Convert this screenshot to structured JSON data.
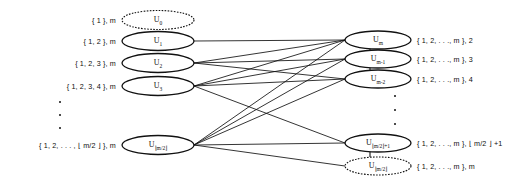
{
  "figure": {
    "background_color": "#ffffff",
    "line_color": "#111111",
    "left_column": {
      "nodes": [
        {
          "id": "u0",
          "label_base": "U",
          "label_sub": "0",
          "style": "dashed",
          "set_label": "{ 1 }, m",
          "cx": 158,
          "cy": 20,
          "rx": 36,
          "ry": 9.5
        },
        {
          "id": "u1",
          "label_base": "U",
          "label_sub": "1",
          "style": "solid",
          "set_label": "{ 1, 2 }, m",
          "cx": 158,
          "cy": 41,
          "rx": 36,
          "ry": 9.5
        },
        {
          "id": "u2",
          "label_base": "U",
          "label_sub": "2",
          "style": "solid",
          "set_label": "{ 1, 2, 3 }, m",
          "cx": 158,
          "cy": 63,
          "rx": 36,
          "ry": 9.5
        },
        {
          "id": "u3",
          "label_base": "U",
          "label_sub": "3",
          "style": "solid",
          "set_label": "{ 1, 2, 3, 4 }, m",
          "cx": 158,
          "cy": 86,
          "rx": 36,
          "ry": 9.5
        },
        {
          "id": "u_half",
          "label_base": "U",
          "label_sub": "⌊m/2⌋",
          "style": "solid",
          "set_label": "{ 1, 2, . . . , ⌊ m/2 ⌋ }, m",
          "cx": 158,
          "cy": 145,
          "rx": 36,
          "ry": 9.5
        }
      ],
      "ellipsis_dots": 3
    },
    "right_column": {
      "nodes": [
        {
          "id": "v_m",
          "label_base": "U",
          "label_sub": "m",
          "style": "solid",
          "set_label": "{ 1, 2, . . ., m }, 2",
          "cx": 378,
          "cy": 40,
          "rx": 33,
          "ry": 9
        },
        {
          "id": "v_m1",
          "label_base": "U",
          "label_sub": "m-1",
          "style": "solid",
          "set_label": "{ 1, 2, . . ., m }, 3",
          "cx": 378,
          "cy": 59,
          "rx": 33,
          "ry": 9
        },
        {
          "id": "v_m2",
          "label_base": "U",
          "label_sub": "m-2",
          "style": "solid",
          "set_label": "{ 1, 2, . . ., m }, 4",
          "cx": 378,
          "cy": 79,
          "rx": 33,
          "ry": 9
        },
        {
          "id": "v_halfp1",
          "label_base": "U",
          "label_sub": "⌊m/2⌋+1",
          "style": "solid",
          "set_label": "{ 1, 2, . . ., m }, ⌊ m/2 ⌋ +1",
          "cx": 378,
          "cy": 143,
          "rx": 33,
          "ry": 9
        },
        {
          "id": "v_half",
          "label_base": "U",
          "label_sub": "⌊m/2⌋",
          "style": "dashed",
          "set_label": "{ 1, 2, . . ., m },   m",
          "cx": 378,
          "cy": 166,
          "rx": 33,
          "ry": 9
        }
      ],
      "ellipsis_dots": 3
    },
    "edges": [
      {
        "from": "u1",
        "to": "v_m"
      },
      {
        "from": "u2",
        "to": "v_m"
      },
      {
        "from": "u2",
        "to": "v_m1"
      },
      {
        "from": "u2",
        "to": "v_m2"
      },
      {
        "from": "u3",
        "to": "v_m"
      },
      {
        "from": "u3",
        "to": "v_m1"
      },
      {
        "from": "u3",
        "to": "v_m2"
      },
      {
        "from": "u3",
        "to": "v_halfp1"
      },
      {
        "from": "u_half",
        "to": "v_m"
      },
      {
        "from": "u_half",
        "to": "v_m1"
      },
      {
        "from": "u_half",
        "to": "v_m2"
      },
      {
        "from": "u_half",
        "to": "v_halfp1"
      },
      {
        "from": "u_half",
        "to": "v_half"
      }
    ],
    "chain_links_right": [
      {
        "from": "v_m",
        "to": "v_m1"
      },
      {
        "from": "v_m1",
        "to": "v_m2"
      },
      {
        "from": "v_halfp1",
        "to": "v_half"
      }
    ]
  }
}
